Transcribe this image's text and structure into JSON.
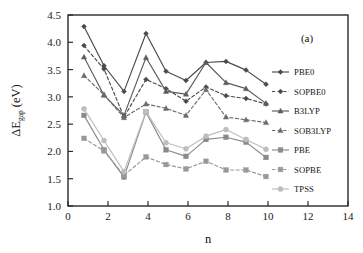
{
  "figure": {
    "panel_label": "(a)",
    "background": "#ffffff"
  },
  "chart_data": {
    "type": "line",
    "title": "",
    "xlabel": "n",
    "ylabel": "ΔE_gap (eV)",
    "ylabel_main": "ΔE",
    "ylabel_sub": "gap",
    "ylabel_unit": " (eV)",
    "xlim": [
      0,
      14
    ],
    "ylim": [
      1.0,
      4.5
    ],
    "xticks": [
      0,
      2,
      4,
      6,
      8,
      10,
      12,
      14
    ],
    "xtick_labels": [
      "0",
      "2",
      "4",
      "6",
      "8",
      "10",
      "12",
      "14"
    ],
    "yticks": [
      1.0,
      1.5,
      2.0,
      2.5,
      3.0,
      3.5,
      4.0,
      4.5
    ],
    "ytick_labels": [
      "1.0",
      "1.5",
      "2.0",
      "2.5",
      "3.0",
      "3.5",
      "4.0",
      "4.5"
    ],
    "grid": false,
    "legend_position": "right-outside",
    "x": [
      0.8,
      1.8,
      2.8,
      3.9,
      4.9,
      5.9,
      6.9,
      7.9,
      8.9,
      9.9
    ],
    "series": [
      {
        "name": "PBE0",
        "color": "#4a4a4a",
        "marker": "diamond",
        "dash": "solid",
        "values": [
          4.29,
          3.57,
          3.1,
          4.16,
          3.47,
          3.3,
          3.63,
          3.65,
          3.49,
          3.23
        ]
      },
      {
        "name": "SOPBE0",
        "color": "#4a4a4a",
        "marker": "diamond",
        "dash": "dashed",
        "values": [
          3.94,
          3.51,
          2.63,
          3.32,
          3.15,
          2.92,
          3.18,
          3.02,
          2.97,
          2.87
        ]
      },
      {
        "name": "B3LYP",
        "color": "#5c5c5c",
        "marker": "triangle",
        "dash": "solid",
        "values": [
          3.73,
          3.03,
          2.66,
          3.72,
          3.1,
          3.05,
          3.63,
          3.26,
          3.15,
          2.88
        ]
      },
      {
        "name": "SOB3LYP",
        "color": "#6b6b6b",
        "marker": "triangle",
        "dash": "dashed",
        "values": [
          3.39,
          3.04,
          2.62,
          2.87,
          2.79,
          2.66,
          3.13,
          2.63,
          2.58,
          2.53
        ]
      },
      {
        "name": "PBE",
        "color": "#8a8a8a",
        "marker": "square",
        "dash": "solid",
        "values": [
          2.66,
          2.03,
          1.53,
          2.72,
          2.03,
          1.91,
          2.22,
          2.26,
          2.17,
          1.89
        ]
      },
      {
        "name": "SOPBE",
        "color": "#999999",
        "marker": "square",
        "dash": "dashed",
        "values": [
          2.24,
          2.01,
          1.56,
          1.9,
          1.76,
          1.68,
          1.82,
          1.66,
          1.66,
          1.54
        ]
      },
      {
        "name": "TPSS",
        "color": "#bdbdbd",
        "marker": "circle",
        "dash": "solid",
        "values": [
          2.78,
          2.2,
          1.63,
          2.73,
          2.16,
          2.05,
          2.28,
          2.4,
          2.22,
          2.04
        ]
      }
    ]
  }
}
